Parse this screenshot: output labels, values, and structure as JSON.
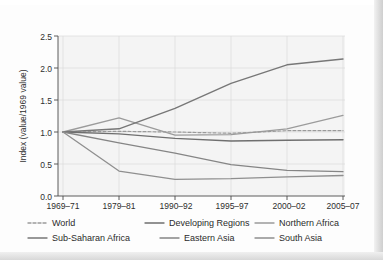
{
  "chart_data": {
    "type": "line",
    "title": "",
    "subtitle": "",
    "xlabel": "",
    "ylabel": "Index  (value/1969 value)",
    "categories": [
      "1969–71",
      "1979–81",
      "1990–92",
      "1995–97",
      "2000–02",
      "2005–07"
    ],
    "ylim": [
      0.0,
      2.5
    ],
    "yticks": [
      "0.0",
      "0.5",
      "1.0",
      "1.5",
      "2.0",
      "2.5"
    ],
    "ytick_values": [
      0.0,
      0.5,
      1.0,
      1.5,
      2.0,
      2.5
    ],
    "grid": true,
    "legend_position": "below",
    "series": [
      {
        "name": "World",
        "color": "#9a9a9a",
        "dash": "3 2",
        "width": 1.2,
        "values": [
          1.0,
          1.01,
          1.0,
          0.98,
          1.02,
          1.02
        ]
      },
      {
        "name": "Developing Regions",
        "color": "#6f6f6f",
        "dash": "none",
        "width": 1.4,
        "values": [
          1.0,
          0.97,
          0.9,
          0.86,
          0.87,
          0.88
        ]
      },
      {
        "name": "Northern Africa",
        "color": "#9b9b9b",
        "dash": "none",
        "width": 1.3,
        "values": [
          1.0,
          1.22,
          0.95,
          0.96,
          1.05,
          1.26
        ]
      },
      {
        "name": "Sub-Saharan Africa",
        "color": "#777777",
        "dash": "none",
        "width": 1.4,
        "values": [
          1.0,
          1.05,
          1.37,
          1.76,
          2.05,
          2.14
        ]
      },
      {
        "name": "Eastern Asia",
        "color": "#858585",
        "dash": "none",
        "width": 1.3,
        "values": [
          1.0,
          0.83,
          0.67,
          0.49,
          0.4,
          0.38
        ]
      },
      {
        "name": "South Asia",
        "color": "#8f8f8f",
        "dash": "none",
        "width": 1.3,
        "values": [
          1.0,
          0.39,
          0.26,
          0.27,
          0.3,
          0.32
        ]
      }
    ]
  },
  "legend": {
    "row1": [
      {
        "label": "World",
        "color": "#9a9a9a"
      },
      {
        "label": "Developing Regions",
        "color": "#6f6f6f"
      },
      {
        "label": "Northern Africa",
        "color": "#9b9b9b"
      }
    ],
    "row2": [
      {
        "label": "Sub-Saharan Africa",
        "color": "#777777"
      },
      {
        "label": "Eastern Asia",
        "color": "#858585"
      },
      {
        "label": "South Asia",
        "color": "#8f8f8f"
      }
    ]
  },
  "axes": {
    "y_title": "Index  (value/1969 value)",
    "y_tick_0": "0.0",
    "y_tick_1": "0.5",
    "y_tick_2": "1.0",
    "y_tick_3": "1.5",
    "y_tick_4": "2.0",
    "y_tick_5": "2.5",
    "x_tick_0": "1969–71",
    "x_tick_1": "1979–81",
    "x_tick_2": "1990–92",
    "x_tick_3": "1995–97",
    "x_tick_4": "2000–02",
    "x_tick_5": "2005–07"
  }
}
